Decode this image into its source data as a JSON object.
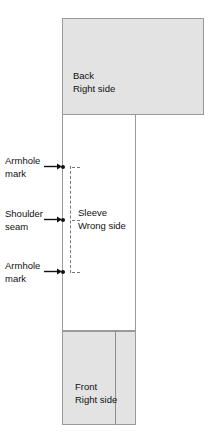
{
  "diagram": {
    "background_color": "#ffffff",
    "fabric_fill_color": "#e3e3e3",
    "outline_color": "#9a9a9a",
    "marker_color": "#111111",
    "dashed_guide_color": "#777777",
    "pieces": [
      {
        "id": "back",
        "label": "Back\nRight side",
        "side": "Right side",
        "shading": "shaded"
      },
      {
        "id": "sleeve",
        "label": "Sleeve\nWrong side",
        "side": "Wrong side",
        "shading": "unshaded"
      },
      {
        "id": "front",
        "label": "Front\nRight side",
        "side": "Right side",
        "shading": "shaded"
      }
    ],
    "markers": [
      {
        "id": "armhole-mark-top",
        "label": "Armhole\nmark",
        "arrow": "right"
      },
      {
        "id": "shoulder-seam",
        "label": "Shoulder\nseam",
        "arrow": "right"
      },
      {
        "id": "armhole-mark-bottom",
        "label": "Armhole\nmark",
        "arrow": "right"
      }
    ],
    "guide_line": {
      "id": "seam-guide",
      "style": "dashed",
      "orientation": "vertical"
    }
  }
}
